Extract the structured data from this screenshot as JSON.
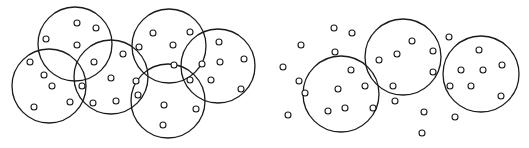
{
  "diagram": {
    "stroke_color": "#1a1a1a",
    "background": "#ffffff",
    "panels": [
      {
        "name": "overlapping-clusters",
        "circles": [
          {
            "cx": 75,
            "cy": 44,
            "r": 37
          },
          {
            "cx": 49,
            "cy": 86,
            "r": 37
          },
          {
            "cx": 111,
            "cy": 77,
            "r": 37
          },
          {
            "cx": 169,
            "cy": 46,
            "r": 37
          },
          {
            "cx": 218,
            "cy": 66,
            "r": 37
          },
          {
            "cx": 168,
            "cy": 101,
            "r": 37
          }
        ],
        "points": [
          [
            77,
            23
          ],
          [
            96,
            28
          ],
          [
            46,
            39
          ],
          [
            77,
            45
          ],
          [
            30,
            62
          ],
          [
            44,
            75
          ],
          [
            52,
            86
          ],
          [
            82,
            86
          ],
          [
            70,
            102
          ],
          [
            34,
            107
          ],
          [
            94,
            62
          ],
          [
            123,
            54
          ],
          [
            111,
            78
          ],
          [
            93,
            103
          ],
          [
            116,
            101
          ],
          [
            139,
            47
          ],
          [
            153,
            33
          ],
          [
            190,
            32
          ],
          [
            173,
            45
          ],
          [
            174,
            65
          ],
          [
            202,
            64
          ],
          [
            219,
            42
          ],
          [
            220,
            62
          ],
          [
            244,
            59
          ],
          [
            136,
            81
          ],
          [
            138,
            95
          ],
          [
            190,
            80
          ],
          [
            211,
            80
          ],
          [
            241,
            89
          ],
          [
            164,
            105
          ],
          [
            196,
            109
          ],
          [
            163,
            125
          ]
        ]
      },
      {
        "name": "separated-clusters-with-noise",
        "circles": [
          {
            "cx": 341,
            "cy": 94,
            "r": 38
          },
          {
            "cx": 403,
            "cy": 57,
            "r": 38
          },
          {
            "cx": 481,
            "cy": 74,
            "r": 38
          }
        ],
        "points": [
          [
            334,
            28
          ],
          [
            352,
            33
          ],
          [
            301,
            45
          ],
          [
            335,
            52
          ],
          [
            283,
            67
          ],
          [
            299,
            81
          ],
          [
            305,
            93
          ],
          [
            351,
            70
          ],
          [
            338,
            89
          ],
          [
            365,
            86
          ],
          [
            328,
            111
          ],
          [
            345,
            108
          ],
          [
            373,
            108
          ],
          [
            288,
            115
          ],
          [
            379,
            60
          ],
          [
            397,
            54
          ],
          [
            412,
            41
          ],
          [
            433,
            51
          ],
          [
            433,
            72
          ],
          [
            393,
            86
          ],
          [
            395,
            101
          ],
          [
            424,
            112
          ],
          [
            422,
            133
          ],
          [
            449,
            37
          ],
          [
            455,
            117
          ],
          [
            479,
            50
          ],
          [
            461,
            70
          ],
          [
            483,
            70
          ],
          [
            502,
            65
          ],
          [
            450,
            86
          ],
          [
            471,
            86
          ],
          [
            501,
            96
          ]
        ]
      }
    ],
    "point_radius": 3
  }
}
